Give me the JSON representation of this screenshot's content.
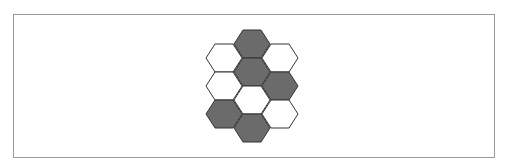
{
  "figure": {
    "panel_label": ")",
    "colors": {
      "shaded": "#6b6b6b",
      "unshaded": "#ffffff",
      "stroke": "#333333",
      "frame": "#9a9a9a"
    },
    "hexagons": [
      {
        "col": 0,
        "row": 0,
        "cx": 224,
        "cy": 58,
        "shaded": false
      },
      {
        "col": 0,
        "row": 1,
        "cx": 224,
        "cy": 86,
        "shaded": false
      },
      {
        "col": 0,
        "row": 2,
        "cx": 224,
        "cy": 114,
        "shaded": true
      },
      {
        "col": 1,
        "row": 0,
        "cx": 252,
        "cy": 44,
        "shaded": true
      },
      {
        "col": 1,
        "row": 1,
        "cx": 252,
        "cy": 72,
        "shaded": true
      },
      {
        "col": 1,
        "row": 2,
        "cx": 252,
        "cy": 100,
        "shaded": false
      },
      {
        "col": 1,
        "row": 3,
        "cx": 252,
        "cy": 128,
        "shaded": true
      },
      {
        "col": 2,
        "row": 0,
        "cx": 280,
        "cy": 58,
        "shaded": false
      },
      {
        "col": 2,
        "row": 1,
        "cx": 280,
        "cy": 86,
        "shaded": true
      },
      {
        "col": 2,
        "row": 2,
        "cx": 280,
        "cy": 114,
        "shaded": false
      }
    ],
    "hex_geometry": {
      "half_width": 18,
      "top_half_width": 9,
      "half_height": 14
    },
    "summary": {
      "total": 10,
      "shaded": 5,
      "unshaded": 5
    }
  }
}
